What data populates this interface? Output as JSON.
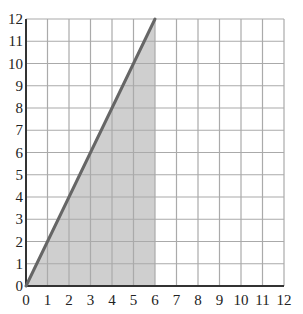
{
  "chart_data": {
    "type": "area",
    "title": "",
    "xlabel": "",
    "ylabel": "",
    "xlim": [
      0,
      12
    ],
    "ylim": [
      0,
      12
    ],
    "grid": true,
    "x_ticks": [
      "0",
      "1",
      "2",
      "3",
      "4",
      "5",
      "6",
      "7",
      "8",
      "9",
      "10",
      "11",
      "12"
    ],
    "y_ticks": [
      "0",
      "1",
      "2",
      "3",
      "4",
      "5",
      "6",
      "7",
      "8",
      "9",
      "10",
      "11",
      "12"
    ],
    "series": [
      {
        "name": "line",
        "type": "line",
        "points": [
          [
            0,
            0
          ],
          [
            6,
            12
          ]
        ],
        "color": "#666666"
      },
      {
        "name": "shaded-region",
        "type": "polygon",
        "points": [
          [
            0,
            0
          ],
          [
            6,
            12
          ],
          [
            6,
            0
          ]
        ],
        "color": "#cfcfcf"
      }
    ]
  },
  "colors": {
    "grid": "#aaaaaa",
    "axis": "#333333",
    "fill": "#cfcfcf",
    "line": "#666666"
  }
}
